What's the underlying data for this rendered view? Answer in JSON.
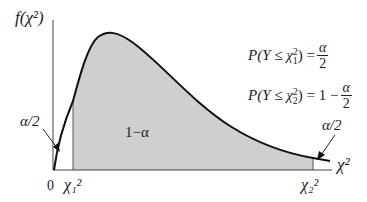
{
  "diagram": {
    "y_axis_label": "f(χ²)",
    "x_axis_label": "χ²",
    "origin_label": "0",
    "lower_critical_label": "χ₁²",
    "upper_critical_label": "χ₂²",
    "center_region_label": "1−α",
    "left_tail_label": "α/2",
    "right_tail_label": "α/2",
    "formulas": [
      {
        "lhs": "P(Y ≤ χ",
        "sub": "1",
        "sup": "2",
        "rhs": ") =",
        "prefix": "",
        "num": "α",
        "den": "2"
      },
      {
        "lhs": "P(Y ≤ χ",
        "sub": "2",
        "sup": "2",
        "rhs": ") = 1 −",
        "prefix": "",
        "num": "α",
        "den": "2"
      }
    ],
    "colors": {
      "shaded_region": "#cfcfcf",
      "curve": "#111111",
      "axis": "#444444",
      "background": "#ffffff"
    }
  }
}
